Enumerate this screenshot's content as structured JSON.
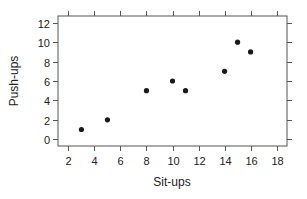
{
  "chart_data": {
    "type": "scatter",
    "title": "",
    "xlabel": "Sit-ups",
    "ylabel": "Push-ups",
    "xlim": [
      1.2,
      18.8
    ],
    "ylim": [
      -0.7,
      12.7
    ],
    "xticks": [
      2,
      4,
      6,
      8,
      10,
      12,
      14,
      16,
      18
    ],
    "yticks": [
      0,
      2,
      4,
      6,
      8,
      10,
      12
    ],
    "grid": false,
    "legend": null,
    "points": [
      {
        "x": 3,
        "y": 1
      },
      {
        "x": 5,
        "y": 2
      },
      {
        "x": 8,
        "y": 5
      },
      {
        "x": 10,
        "y": 6
      },
      {
        "x": 11,
        "y": 5
      },
      {
        "x": 14,
        "y": 7
      },
      {
        "x": 15,
        "y": 10
      },
      {
        "x": 16,
        "y": 9
      }
    ],
    "marker_color": "#1a1a1a",
    "frame_color": "#555555"
  }
}
